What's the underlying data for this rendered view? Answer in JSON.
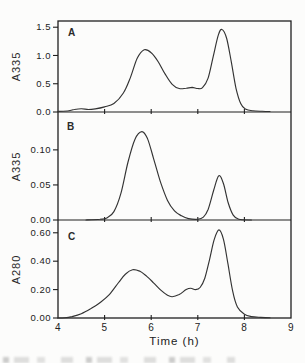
{
  "chart_data": {
    "type": "line",
    "title": "",
    "xlabel": "Time (h)",
    "xlim": [
      4,
      9
    ],
    "xtick_labels": [
      "4",
      "5",
      "6",
      "7",
      "8",
      "9"
    ],
    "xticks_labeled": [
      4,
      5,
      6,
      7,
      8,
      9
    ],
    "grid": false,
    "line_color": "#333333",
    "axis_color": "#1f1f1f",
    "background": "#fcfcfb",
    "panels": [
      {
        "label": "A",
        "ylabel": "A335",
        "ylim": [
          0,
          1.61
        ],
        "yticks": [
          0.0,
          0.5,
          1.0,
          1.5
        ],
        "ytick_labels": [
          "0.0",
          "0.5",
          "1.0",
          "1.5"
        ],
        "xticks": [
          5,
          6,
          7,
          8
        ],
        "peaks": [
          {
            "t": 5.85,
            "value": 1.1
          },
          {
            "t": 7.52,
            "value": 1.46
          }
        ],
        "points": [
          [
            4.0,
            0.01
          ],
          [
            4.2,
            0.018
          ],
          [
            4.35,
            0.045
          ],
          [
            4.5,
            0.058
          ],
          [
            4.65,
            0.045
          ],
          [
            4.8,
            0.055
          ],
          [
            5.0,
            0.09
          ],
          [
            5.2,
            0.15
          ],
          [
            5.4,
            0.33
          ],
          [
            5.55,
            0.6
          ],
          [
            5.7,
            0.95
          ],
          [
            5.85,
            1.1
          ],
          [
            6.0,
            1.05
          ],
          [
            6.15,
            0.89
          ],
          [
            6.3,
            0.67
          ],
          [
            6.45,
            0.49
          ],
          [
            6.6,
            0.415
          ],
          [
            6.75,
            0.42
          ],
          [
            6.88,
            0.435
          ],
          [
            7.0,
            0.415
          ],
          [
            7.1,
            0.43
          ],
          [
            7.22,
            0.6
          ],
          [
            7.33,
            0.98
          ],
          [
            7.44,
            1.36
          ],
          [
            7.52,
            1.46
          ],
          [
            7.62,
            1.3
          ],
          [
            7.72,
            0.88
          ],
          [
            7.82,
            0.42
          ],
          [
            7.92,
            0.15
          ],
          [
            8.02,
            0.055
          ],
          [
            8.18,
            0.022
          ],
          [
            8.38,
            0.012
          ],
          [
            8.55,
            0.008
          ]
        ]
      },
      {
        "label": "B",
        "ylabel": "A335",
        "ylim": [
          0,
          0.154
        ],
        "yticks": [
          0.0,
          0.05,
          0.1
        ],
        "ytick_labels": [
          "0.00",
          "0.05",
          "0.10"
        ],
        "xticks": [
          5,
          6,
          7,
          8
        ],
        "peaks": [
          {
            "t": 5.8,
            "value": 0.126
          },
          {
            "t": 7.45,
            "value": 0.063
          }
        ],
        "points": [
          [
            4.6,
            0.0
          ],
          [
            4.9,
            0.001
          ],
          [
            5.05,
            0.003
          ],
          [
            5.2,
            0.012
          ],
          [
            5.35,
            0.038
          ],
          [
            5.5,
            0.082
          ],
          [
            5.65,
            0.115
          ],
          [
            5.8,
            0.126
          ],
          [
            5.92,
            0.116
          ],
          [
            6.05,
            0.088
          ],
          [
            6.2,
            0.054
          ],
          [
            6.35,
            0.028
          ],
          [
            6.5,
            0.013
          ],
          [
            6.65,
            0.006
          ],
          [
            6.8,
            0.002
          ],
          [
            7.0,
            0.001
          ],
          [
            7.12,
            0.004
          ],
          [
            7.22,
            0.015
          ],
          [
            7.34,
            0.042
          ],
          [
            7.45,
            0.063
          ],
          [
            7.55,
            0.052
          ],
          [
            7.65,
            0.025
          ],
          [
            7.76,
            0.007
          ],
          [
            7.88,
            0.001
          ],
          [
            8.15,
            0.0
          ]
        ]
      },
      {
        "label": "C",
        "ylabel": "A280",
        "ylim": [
          0,
          0.69
        ],
        "yticks": [
          0.0,
          0.2,
          0.4,
          0.6
        ],
        "ytick_labels": [
          "0.00",
          "0.20",
          "0.40",
          "0.60"
        ],
        "xticks": [
          5,
          6,
          7,
          8
        ],
        "peaks": [
          {
            "t": 5.6,
            "value": 0.34
          },
          {
            "t": 7.45,
            "value": 0.62
          }
        ],
        "points": [
          [
            4.0,
            0.0
          ],
          [
            4.15,
            0.002
          ],
          [
            4.3,
            0.01
          ],
          [
            4.5,
            0.03
          ],
          [
            4.7,
            0.065
          ],
          [
            4.9,
            0.108
          ],
          [
            5.1,
            0.165
          ],
          [
            5.3,
            0.25
          ],
          [
            5.45,
            0.31
          ],
          [
            5.6,
            0.34
          ],
          [
            5.75,
            0.33
          ],
          [
            5.9,
            0.295
          ],
          [
            6.05,
            0.248
          ],
          [
            6.2,
            0.198
          ],
          [
            6.35,
            0.16
          ],
          [
            6.45,
            0.15
          ],
          [
            6.6,
            0.165
          ],
          [
            6.75,
            0.2
          ],
          [
            6.85,
            0.21
          ],
          [
            6.95,
            0.2
          ],
          [
            7.05,
            0.215
          ],
          [
            7.15,
            0.28
          ],
          [
            7.25,
            0.41
          ],
          [
            7.35,
            0.55
          ],
          [
            7.45,
            0.62
          ],
          [
            7.55,
            0.555
          ],
          [
            7.65,
            0.375
          ],
          [
            7.75,
            0.185
          ],
          [
            7.85,
            0.078
          ],
          [
            8.0,
            0.026
          ],
          [
            8.15,
            0.01
          ],
          [
            8.35,
            0.004
          ],
          [
            8.55,
            0.002
          ]
        ]
      }
    ]
  }
}
